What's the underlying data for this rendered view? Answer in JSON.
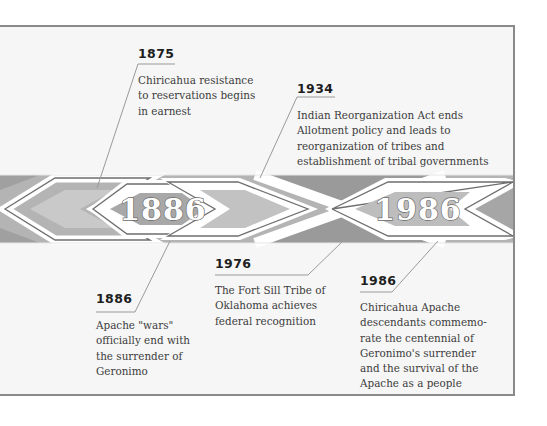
{
  "timeline": {
    "banner": {
      "left_badge": "1886",
      "right_badge": "1986"
    },
    "events": [
      {
        "id": "1875",
        "year": "1875",
        "description": "Chiricahua resistance\nto  reservations begins\nin earnest",
        "position": "above"
      },
      {
        "id": "1934",
        "year": "1934",
        "description": "Indian Reorganization Act ends\nAllotment policy and leads to\nreorganization of tribes and\nestablishment of tribal governments",
        "position": "above"
      },
      {
        "id": "1886",
        "year": "1886",
        "description": "Apache \"wars\"\nofficially end with\nthe surrender of\nGeronimo",
        "position": "below"
      },
      {
        "id": "1976",
        "year": "1976",
        "description": "The Fort Sill Tribe of\nOklahoma achieves\nfederal recognition",
        "position": "below"
      },
      {
        "id": "1986",
        "year": "1986",
        "description": "Chiricahua Apache\ndescendants commemo-\nrate the centennial of\nGeronimo's surrender\nand the survival of the\nApache as a people",
        "position": "below"
      }
    ]
  },
  "colors": {
    "frame_border": "#8a8a8a",
    "frame_fill": "#f6f6f6",
    "band_dark": "#9d9d9d",
    "band_mid": "#b9b9b9",
    "band_light": "#d2d2d2",
    "stripe": "#ffffff",
    "outline": "#6e6e6e",
    "connector": "#9a9a9a"
  }
}
